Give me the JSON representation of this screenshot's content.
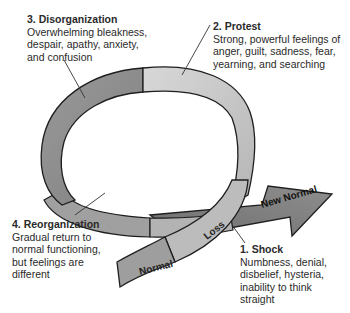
{
  "stages": [
    {
      "id": "stage1",
      "title": "1. Shock",
      "lines": [
        "Numbness, denial,",
        "disbelief, hysteria,",
        "inability to think",
        "straight"
      ]
    },
    {
      "id": "stage2",
      "title": "2. Protest",
      "lines": [
        "Strong, powerful feelings of",
        "anger, guilt, sadness, fear,",
        "yearning, and searching"
      ]
    },
    {
      "id": "stage3",
      "title": "3. Disorganization",
      "lines": [
        "Overwhelming bleakness,",
        "despair, apathy, anxiety,",
        "and confusion"
      ]
    },
    {
      "id": "stage4",
      "title": "4. Reorganization",
      "lines": [
        "Gradual return to",
        "normal functioning,",
        "but feelings are",
        "different"
      ]
    }
  ],
  "ribbon_labels": {
    "normal": "Normal",
    "loss": "Loss",
    "new_normal": "New Normal"
  },
  "colors": {
    "disorganization_segment": "#8f8f8f",
    "protest_segment": "#c8c8c8",
    "loss_segment": "#bdbdbd",
    "normal_segment": "#9c9c9c",
    "new_normal_arrow": "#7e7e7e",
    "reorganization_segment": "#a5a5a5",
    "outline": "#1e1e1e"
  }
}
